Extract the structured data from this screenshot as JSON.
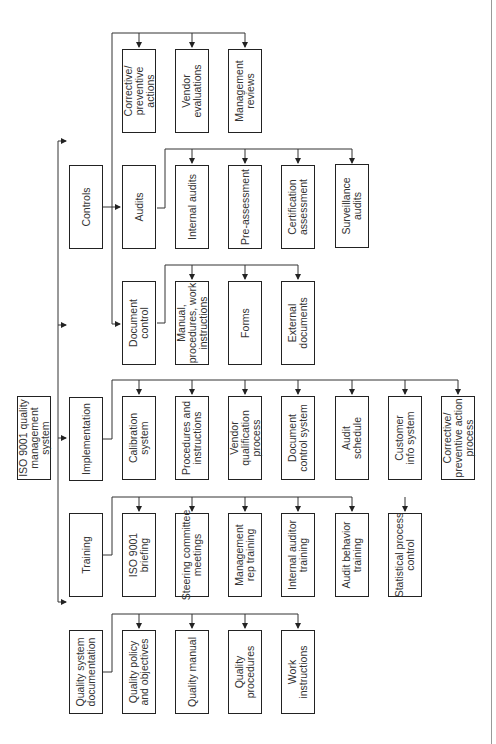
{
  "diagram": {
    "orientation": "rotated-90-ccw",
    "root": {
      "id": "root",
      "label": "ISO 9001 quality\nmanagement\nsystem"
    },
    "branches": [
      {
        "id": "quality-system-documentation",
        "label": "Quality system\ndocumentation",
        "children": [
          {
            "id": "quality-policy",
            "label": "Quality policy\nand objectives"
          },
          {
            "id": "quality-manual",
            "label": "Quality manual"
          },
          {
            "id": "quality-procedures",
            "label": "Quality\nprocedures"
          },
          {
            "id": "work-instructions",
            "label": "Work\ninstructions"
          }
        ]
      },
      {
        "id": "training",
        "label": "Training",
        "children": [
          {
            "id": "iso-briefing",
            "label": "ISO 9001\nbriefing"
          },
          {
            "id": "steering-committee",
            "label": "Steering committee\nmeetings"
          },
          {
            "id": "management-rep-training",
            "label": "Management\nrep training"
          },
          {
            "id": "internal-auditor-training",
            "label": "Internal auditor\ntraining"
          },
          {
            "id": "audit-behavior-training",
            "label": "Audit behavior\ntraining"
          },
          {
            "id": "statistical-process-control",
            "label": "Statistical process\ncontrol"
          }
        ]
      },
      {
        "id": "implementation",
        "label": "Implementation",
        "children": [
          {
            "id": "calibration-system",
            "label": "Calibration\nsystem"
          },
          {
            "id": "procedures-instructions",
            "label": "Procedures and\ninstructions"
          },
          {
            "id": "vendor-qualification",
            "label": "Vendor\nqualification\nprocess"
          },
          {
            "id": "document-control-system",
            "label": "Document\ncontrol system"
          },
          {
            "id": "audit-schedule",
            "label": "Audit\nschedule"
          },
          {
            "id": "customer-info-system",
            "label": "Customer\ninfo system"
          },
          {
            "id": "corrective-preventive-process",
            "label": "Corrective/\npreventive action\nprocess"
          }
        ]
      },
      {
        "id": "controls",
        "label": "Controls",
        "children": [
          {
            "id": "document-control",
            "label": "Document\ncontrol",
            "children": [
              {
                "id": "manual-procedures",
                "label": "Manual,\nprocedures, work\ninstructions"
              },
              {
                "id": "forms",
                "label": "Forms"
              },
              {
                "id": "external-documents",
                "label": "External\ndocuments"
              }
            ]
          },
          {
            "id": "audits",
            "label": "Audits",
            "children": [
              {
                "id": "internal-audits",
                "label": "Internal audits"
              },
              {
                "id": "pre-assessment",
                "label": "Pre-assessment"
              },
              {
                "id": "certification-assessment",
                "label": "Certification\nassessment"
              },
              {
                "id": "surveillance-audits",
                "label": "Surveillance\naudits"
              }
            ]
          },
          {
            "id": "controls-direct",
            "children": [
              {
                "id": "corrective-preventive-actions",
                "label": "Corrective/\npreventive\nactions"
              },
              {
                "id": "vendor-evaluations",
                "label": "Vendor\nevaluations"
              },
              {
                "id": "management-reviews",
                "label": "Management\nreviews"
              }
            ]
          }
        ]
      }
    ]
  },
  "labels": {
    "root": "ISO 9001 quality\nmanagement\nsystem",
    "qsd": "Quality system\ndocumentation",
    "training": "Training",
    "implementation": "Implementation",
    "controls": "Controls",
    "qpo": "Quality policy\nand objectives",
    "qm": "Quality manual",
    "qp": "Quality\nprocedures",
    "wi": "Work\ninstructions",
    "t1": "ISO 9001\nbriefing",
    "t2": "Steering committee\nmeetings",
    "t3": "Management\nrep training",
    "t4": "Internal auditor\ntraining",
    "t5": "Audit behavior\ntraining",
    "t6": "Statistical process\ncontrol",
    "i1": "Calibration\nsystem",
    "i2": "Procedures and\ninstructions",
    "i3": "Vendor\nqualification\nprocess",
    "i4": "Document\ncontrol system",
    "i5": "Audit\nschedule",
    "i6": "Customer\ninfo system",
    "i7": "Corrective/\npreventive action\nprocess",
    "dc": "Document\ncontrol",
    "dc1": "Manual,\nprocedures, work\ninstructions",
    "dc2": "Forms",
    "dc3": "External\ndocuments",
    "au": "Audits",
    "au1": "Internal audits",
    "au2": "Pre-assessment",
    "au3": "Certification\nassessment",
    "au4": "Surveillance\naudits",
    "c1": "Corrective/\npreventive\nactions",
    "c2": "Vendor\nevaluations",
    "c3": "Management\nreviews"
  }
}
